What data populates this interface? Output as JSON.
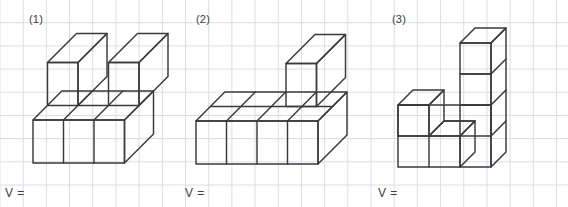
{
  "page": {
    "width": 568,
    "height": 207,
    "background_color": "#ffffff",
    "grid_color": "#d7dce9",
    "grid_spacing_px": 23.2,
    "stroke_color": "#3a3a3a",
    "text_color": "#3c3c3c"
  },
  "figures": [
    {
      "id": "figure-1",
      "label": "(1)",
      "answer_prompt": "V =",
      "description": "Rectangular solid of unit cubes: a 3 wide by 2 deep by 1 tall base slab with 2 extra cubes on the top, placed at the front-left and front-right columns, leaving a gap in the middle.",
      "cube_count": 8,
      "base": {
        "width": 3,
        "depth": 2,
        "height": 1
      },
      "top_cubes": 2,
      "origin": {
        "x": 33,
        "y": 163
      },
      "cell": 30.5,
      "depth_dx": 14.5,
      "depth_dy": -14.5,
      "cubes": [
        [
          0,
          0,
          0
        ],
        [
          1,
          0,
          0
        ],
        [
          2,
          0,
          0
        ],
        [
          0,
          1,
          0
        ],
        [
          1,
          1,
          0
        ],
        [
          2,
          1,
          0
        ],
        [
          0,
          0,
          1
        ],
        [
          2,
          0,
          1
        ]
      ]
    },
    {
      "id": "figure-2",
      "label": "(2)",
      "answer_prompt": "V =",
      "description": "A 4 wide by 2 deep by 1 tall base slab of unit cubes with a single extra cube sitting on top of the back row at the third column.",
      "cube_count": 9,
      "base": {
        "width": 4,
        "depth": 2,
        "height": 1
      },
      "top_cubes": 1,
      "origin": {
        "x": 196,
        "y": 164
      },
      "cell": 30.5,
      "depth_dx": 14.5,
      "depth_dy": -14.5,
      "cubes": [
        [
          0,
          0,
          0
        ],
        [
          1,
          0,
          0
        ],
        [
          2,
          0,
          0
        ],
        [
          3,
          0,
          0
        ],
        [
          0,
          1,
          0
        ],
        [
          1,
          1,
          0
        ],
        [
          2,
          1,
          0
        ],
        [
          3,
          1,
          0
        ],
        [
          2,
          1,
          1
        ]
      ]
    },
    {
      "id": "figure-3",
      "label": "(3)",
      "answer_prompt": "V =",
      "description": "A staircase shape of unit cubes: a 3 wide by 1 deep bottom row, a cube stacked on the left column, and a 3 cube tall tower on the right column.",
      "cube_count": 7,
      "base": {
        "width": 3,
        "depth": 1,
        "height": 1
      },
      "top_cubes": 4,
      "origin": {
        "x": 398,
        "y": 167
      },
      "cell": 31,
      "depth_dx": 15,
      "depth_dy": -15,
      "cubes": [
        [
          0,
          0,
          0
        ],
        [
          1,
          0,
          0
        ],
        [
          2,
          0,
          0
        ],
        [
          0,
          0,
          1
        ],
        [
          2,
          0,
          1
        ],
        [
          2,
          0,
          2
        ],
        [
          2,
          0,
          3
        ]
      ]
    }
  ]
}
